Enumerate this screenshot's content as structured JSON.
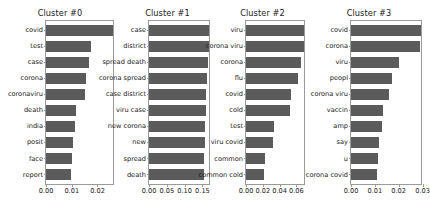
{
  "figure": {
    "background_color": "#ffffff",
    "bar_color": "#5b5b5b",
    "axis_color": "#9a9a9a",
    "text_color": "#1a1a1a"
  },
  "chart_data": [
    {
      "type": "bar",
      "title": "Cluster #0",
      "orientation": "horizontal",
      "xlabel": "",
      "ylabel": "",
      "grid": false,
      "legend": "none",
      "xlim": [
        0.0,
        0.0268
      ],
      "xticks": [
        0.0,
        0.01,
        0.02
      ],
      "xtick_labels": [
        "0.00",
        "0.01",
        "0.02"
      ],
      "categories": [
        "covid",
        "test",
        "case",
        "corona",
        "coronaviru",
        "death",
        "india",
        "posit",
        "face",
        "report"
      ],
      "values": [
        0.0268,
        0.0174,
        0.0167,
        0.0157,
        0.0152,
        0.0118,
        0.0113,
        0.0104,
        0.01,
        0.0099
      ]
    },
    {
      "type": "bar",
      "title": "Cluster #1",
      "orientation": "horizontal",
      "xlabel": "",
      "ylabel": "",
      "grid": false,
      "legend": "none",
      "xlim": [
        0.0,
        0.174
      ],
      "xticks": [
        0.0,
        0.05,
        0.1,
        0.15
      ],
      "xtick_labels": [
        "0.00",
        "0.05",
        "0.10",
        "0.15"
      ],
      "categories": [
        "case",
        "district",
        "spread death",
        "corona spread",
        "case district",
        "viru case",
        "new corona",
        "new",
        "spread",
        "death"
      ],
      "values": [
        0.174,
        0.168,
        0.166,
        0.163,
        0.161,
        0.16,
        0.158,
        0.157,
        0.155,
        0.154
      ]
    },
    {
      "type": "bar",
      "title": "Cluster #2",
      "orientation": "horizontal",
      "xlabel": "",
      "ylabel": "",
      "grid": false,
      "legend": "none",
      "xlim": [
        0.0,
        0.0715
      ],
      "xticks": [
        0.0,
        0.02,
        0.04,
        0.06
      ],
      "xtick_labels": [
        "0.00",
        "0.02",
        "0.04",
        "0.06"
      ],
      "categories": [
        "viru",
        "corona viru",
        "corona",
        "flu",
        "covid",
        "cold",
        "test",
        "viru covid",
        "common",
        "common cold"
      ],
      "values": [
        0.0715,
        0.069,
        0.066,
        0.062,
        0.054,
        0.052,
        0.033,
        0.032,
        0.023,
        0.0215
      ]
    },
    {
      "type": "bar",
      "title": "Cluster #3",
      "orientation": "horizontal",
      "xlabel": "",
      "ylabel": "",
      "grid": false,
      "legend": "none",
      "xlim": [
        0.0,
        0.0302
      ],
      "xticks": [
        0.0,
        0.01,
        0.02,
        0.03
      ],
      "xtick_labels": [
        "0.00",
        "0.01",
        "0.02",
        "0.03"
      ],
      "categories": [
        "covid",
        "corona",
        "viru",
        "peopl",
        "corona viru",
        "vaccin",
        "amp",
        "say",
        "u",
        "corona covid"
      ],
      "values": [
        0.0302,
        0.0288,
        0.02,
        0.0172,
        0.0161,
        0.0135,
        0.0128,
        0.0118,
        0.0112,
        0.011
      ]
    }
  ]
}
